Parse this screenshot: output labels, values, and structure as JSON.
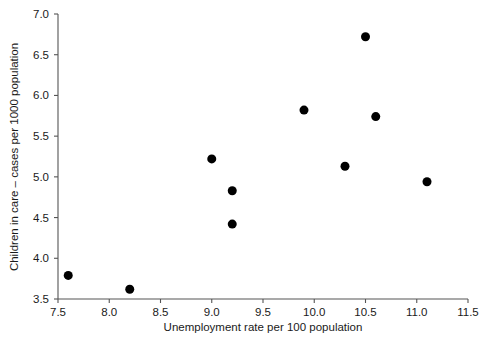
{
  "chart_data": {
    "type": "scatter",
    "title": "",
    "xlabel": "Unemployment rate per 100 population",
    "ylabel": "Children in care – cases per 1000 population",
    "xlim": [
      7.5,
      11.5
    ],
    "ylim": [
      3.5,
      7.0
    ],
    "xticks": [
      7.5,
      8.0,
      8.5,
      9.0,
      9.5,
      10.0,
      10.5,
      11.0,
      11.5
    ],
    "xtick_labels": [
      "7.5",
      "8.0",
      "8.5",
      "9.0",
      "9.5",
      "10.0",
      "10.5",
      "11.0",
      "11.5"
    ],
    "yticks": [
      3.5,
      4.0,
      4.5,
      5.0,
      5.5,
      6.0,
      6.5,
      7.0
    ],
    "ytick_labels": [
      "3.5",
      "4.0",
      "4.5",
      "5.0",
      "5.5",
      "6.0",
      "6.5",
      "7.0"
    ],
    "grid": false,
    "legend": false,
    "marker": "filled-circle",
    "marker_color": "#000000",
    "marker_size": 9,
    "points": [
      {
        "x": 7.6,
        "y": 3.79
      },
      {
        "x": 8.2,
        "y": 3.62
      },
      {
        "x": 9.0,
        "y": 5.22
      },
      {
        "x": 9.2,
        "y": 4.83
      },
      {
        "x": 9.2,
        "y": 4.42
      },
      {
        "x": 9.9,
        "y": 5.82
      },
      {
        "x": 10.3,
        "y": 5.13
      },
      {
        "x": 10.5,
        "y": 6.72
      },
      {
        "x": 10.6,
        "y": 5.74
      },
      {
        "x": 11.1,
        "y": 4.94
      }
    ]
  },
  "axes": {
    "x_axis_name": "unemployment-rate-axis",
    "y_axis_name": "children-in-care-axis"
  },
  "colors": {
    "background": "#ffffff",
    "axis": "#555555",
    "text": "#1a1a1a",
    "marker": "#000000"
  }
}
